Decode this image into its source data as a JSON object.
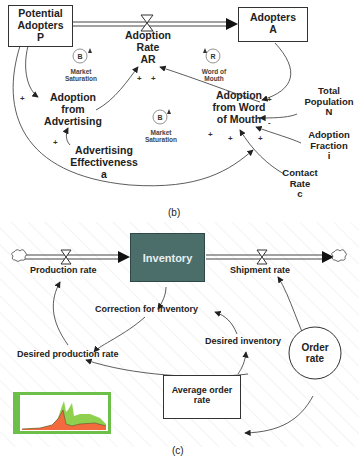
{
  "panel_b": {
    "caption": "(b)",
    "stocks": [
      {
        "id": "potential",
        "lines": [
          "Potential",
          "Adopters",
          "P"
        ]
      },
      {
        "id": "adopters",
        "lines": [
          "Adopters",
          "A"
        ]
      }
    ],
    "flow": {
      "lines": [
        "Adoption",
        "Rate",
        "AR"
      ]
    },
    "variables": [
      {
        "id": "adv",
        "lines": [
          "Adoption",
          "from",
          "Advertising"
        ]
      },
      {
        "id": "wom",
        "lines": [
          "Adoption",
          "from Word",
          "of Mouth"
        ]
      },
      {
        "id": "eff",
        "lines": [
          "Advertising",
          "Effectiveness",
          "a"
        ]
      },
      {
        "id": "pop",
        "lines": [
          "Total",
          "Population",
          "N"
        ]
      },
      {
        "id": "frac",
        "lines": [
          "Adoption",
          "Fraction",
          "i"
        ]
      },
      {
        "id": "contact",
        "lines": [
          "Contact",
          "Rate",
          "c"
        ]
      }
    ],
    "loops": [
      {
        "letter": "B",
        "label": [
          "Market",
          "Saturation"
        ]
      },
      {
        "letter": "R",
        "label": [
          "Word of",
          "Mouth"
        ]
      },
      {
        "letter": "B",
        "label": [
          "Market",
          "Saturation"
        ]
      }
    ],
    "signs": {
      "plus": "+",
      "minus": "-"
    }
  },
  "panel_c": {
    "caption": "(c)",
    "stock": "Inventory",
    "flows": [
      "Production rate",
      "Shipment rate"
    ],
    "variables": [
      "Correction for inventory",
      "Desired production rate",
      "Desired inventory",
      "Average order rate"
    ],
    "avg_lines": [
      "Average order",
      "rate"
    ],
    "order": [
      "Order",
      "rate"
    ],
    "colors": {
      "stock_fill": "#4b6e6b",
      "chart_border": "#6cc04a",
      "chart_green": "#8fd14f",
      "chart_red": "#f26a3d"
    }
  }
}
